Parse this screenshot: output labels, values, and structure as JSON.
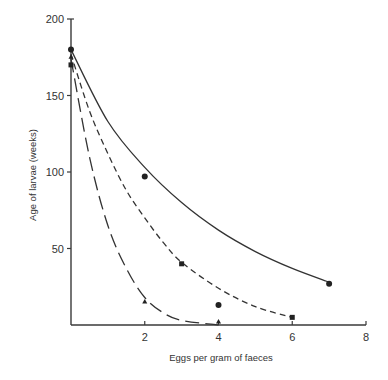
{
  "chart_data": {
    "type": "scatter",
    "title": "",
    "xlabel": "Eggs per gram of faeces",
    "ylabel": "Age of larvae (weeks)",
    "xlim": [
      0,
      8
    ],
    "ylim": [
      0,
      200
    ],
    "x_ticks": [
      2,
      4,
      6,
      8
    ],
    "y_ticks": [
      50,
      100,
      150,
      200
    ],
    "grid": false,
    "legend": null,
    "series": [
      {
        "name": "circles",
        "marker": "circle",
        "line_style": "solid",
        "points": [
          [
            0,
            180
          ],
          [
            2,
            97
          ],
          [
            4,
            13
          ],
          [
            7,
            27
          ]
        ],
        "fit_curve": [
          [
            0,
            180
          ],
          [
            1,
            133
          ],
          [
            2,
            103
          ],
          [
            3,
            80
          ],
          [
            4,
            62
          ],
          [
            5,
            48
          ],
          [
            6,
            37
          ],
          [
            7,
            28
          ]
        ]
      },
      {
        "name": "squares",
        "marker": "square",
        "line_style": "short-dash",
        "points": [
          [
            0,
            170
          ],
          [
            3,
            40
          ],
          [
            6,
            5
          ]
        ],
        "fit_curve": [
          [
            0,
            177
          ],
          [
            0.5,
            140
          ],
          [
            1,
            112
          ],
          [
            1.5,
            88
          ],
          [
            2,
            70
          ],
          [
            2.5,
            54
          ],
          [
            3,
            41
          ],
          [
            4,
            24
          ],
          [
            5,
            12
          ],
          [
            6,
            5
          ]
        ]
      },
      {
        "name": "triangles",
        "marker": "triangle",
        "line_style": "long-dash",
        "points": [
          [
            0,
            175
          ],
          [
            2,
            15
          ],
          [
            4,
            2
          ]
        ],
        "fit_curve": [
          [
            0,
            174
          ],
          [
            0.5,
            110
          ],
          [
            1,
            65
          ],
          [
            1.5,
            37
          ],
          [
            2,
            18
          ],
          [
            2.5,
            8
          ],
          [
            3,
            3
          ],
          [
            4,
            0
          ]
        ]
      }
    ]
  },
  "axes": {
    "x_label": "Eggs per gram of faeces",
    "y_label": "Age of larvae (weeks)",
    "x_tick_labels": [
      "2",
      "4",
      "6",
      "8"
    ],
    "y_tick_labels": [
      "50",
      "100",
      "150",
      "200"
    ]
  }
}
